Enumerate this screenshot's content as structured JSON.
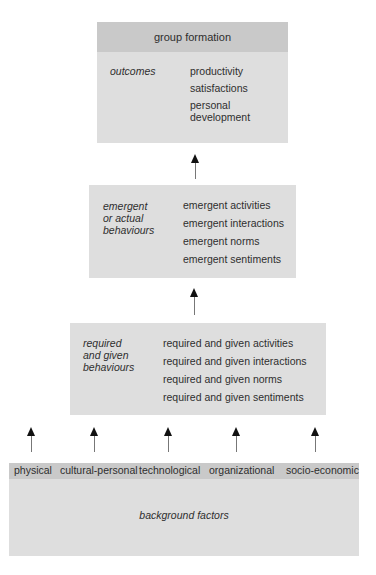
{
  "top_box": {
    "title": "group formation",
    "label": "outcomes",
    "items": [
      "productivity",
      "satisfactions",
      "personal",
      "development"
    ]
  },
  "middle_box": {
    "label_lines": [
      "emergent",
      "or actual",
      "behaviours"
    ],
    "items": [
      "emergent activities",
      "emergent interactions",
      "emergent norms",
      "emergent sentiments"
    ]
  },
  "required_box": {
    "label_lines": [
      "required",
      "and given",
      "behaviours"
    ],
    "items": [
      "required and given activities",
      "required and given interactions",
      "required and given norms",
      "required and given sentiments"
    ]
  },
  "background_box": {
    "factors": [
      "physical",
      "cultural-personal",
      "technological",
      "organizational",
      "socio-economic"
    ],
    "label": "background factors"
  },
  "colors": {
    "box_fill": "#dedede",
    "header_fill": "#c9c9c9",
    "text": "#2e2e2e",
    "arrow_head": "#111111",
    "arrow_shaft": "#777777"
  }
}
